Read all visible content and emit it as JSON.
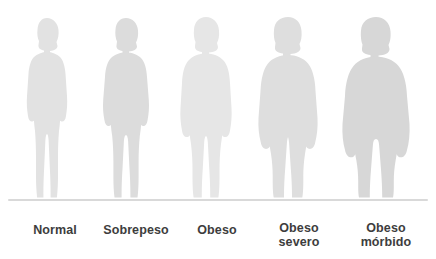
{
  "infographic": {
    "title_text": "",
    "background_color": "#ffffff",
    "baseline_color": "#d9d9d9",
    "label_color": "#3d3d3d",
    "silhouette_colors": {
      "normal": "#e2e2e2",
      "sobrepeso": "#dcdcdc",
      "obeso": "#e6e6e6",
      "obeso_severo": "#dedede",
      "obeso_morbido": "#d7d7d7"
    },
    "figures": [
      {
        "id": "normal",
        "label_line1": "Normal",
        "label_line2": "",
        "fill": "#e2e2e2"
      },
      {
        "id": "sobrepeso",
        "label_line1": "Sobrepeso",
        "label_line2": "",
        "fill": "#dcdcdc"
      },
      {
        "id": "obeso",
        "label_line1": "Obeso",
        "label_line2": "",
        "fill": "#e6e6e6"
      },
      {
        "id": "obeso-severo",
        "label_line1": "Obeso",
        "label_line2": "severo",
        "fill": "#dedede"
      },
      {
        "id": "obeso-morbido",
        "label_line1": "Obeso",
        "label_line2": "mórbido",
        "fill": "#d7d7d7"
      }
    ]
  }
}
